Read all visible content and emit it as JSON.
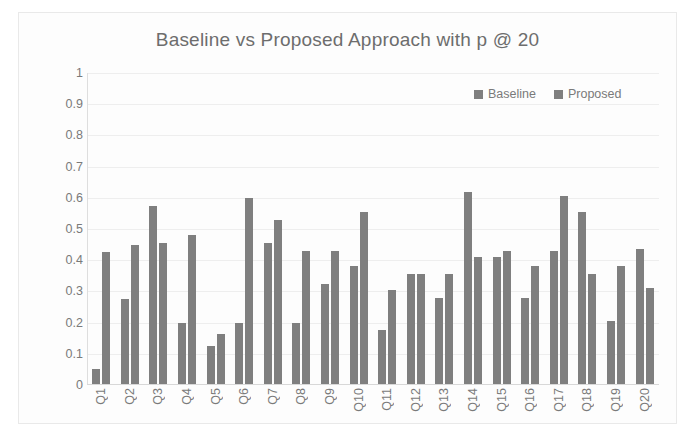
{
  "chart_data": {
    "type": "bar",
    "title": "Baseline vs Proposed Approach with p @ 20",
    "xlabel": "",
    "ylabel": "",
    "ylim": [
      0,
      1
    ],
    "yticks": [
      "0",
      "0.1",
      "0.2",
      "0.3",
      "0.4",
      "0.5",
      "0.6",
      "0.7",
      "0.8",
      "0.9",
      "1"
    ],
    "grid": true,
    "legend_position": "top-right",
    "categories": [
      "Q1",
      "Q2",
      "Q3",
      "Q4",
      "Q5",
      "Q6",
      "Q7",
      "Q8",
      "Q9",
      "Q10",
      "Q11",
      "Q12",
      "Q13",
      "Q14",
      "Q15",
      "Q16",
      "Q17",
      "Q18",
      "Q19",
      "Q20"
    ],
    "series": [
      {
        "name": "Baseline",
        "color": "#7f7f7f",
        "values": [
          0.05,
          0.275,
          0.575,
          0.2,
          0.125,
          0.2,
          0.455,
          0.2,
          0.325,
          0.38,
          0.175,
          0.355,
          0.28,
          0.62,
          0.41,
          0.28,
          0.43,
          0.555,
          0.205,
          0.435
        ]
      },
      {
        "name": "Proposed",
        "color": "#7f7f7f",
        "values": [
          0.425,
          0.45,
          0.455,
          0.48,
          0.165,
          0.6,
          0.53,
          0.43,
          0.43,
          0.555,
          0.305,
          0.355,
          0.355,
          0.41,
          0.43,
          0.38,
          0.605,
          0.355,
          0.38,
          0.31
        ]
      }
    ]
  },
  "colors": {
    "bar": "#7f7f7f",
    "title": "#6d6d6d",
    "tick": "#7a7a7a",
    "grid": "#eeeeee",
    "card_bg": "#fdfdfd"
  }
}
